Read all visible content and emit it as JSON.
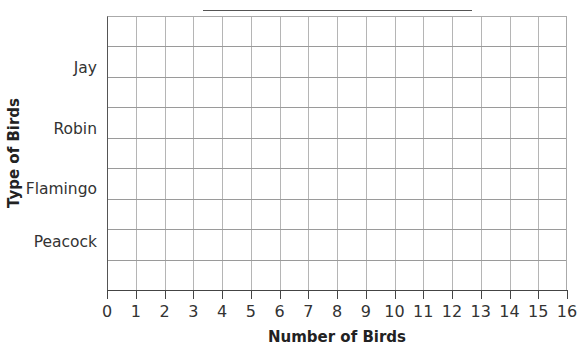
{
  "chart_data": {
    "type": "bar",
    "orientation": "horizontal",
    "title": "",
    "title_blank_line": true,
    "categories": [
      "Jay",
      "Robin",
      "Flamingo",
      "Peacock"
    ],
    "values": [
      null,
      null,
      null,
      null
    ],
    "xlabel": "Number of Birds",
    "ylabel": "Type of Birds",
    "xlim": [
      0,
      16
    ],
    "xticks": [
      "0",
      "1",
      "2",
      "3",
      "4",
      "5",
      "6",
      "7",
      "8",
      "9",
      "10",
      "11",
      "12",
      "13",
      "14",
      "15",
      "16"
    ],
    "grid": true,
    "legend": null,
    "note": "Blank bar graph template; no bars drawn"
  },
  "labels": {
    "xlabel": "Number of Birds",
    "ylabel": "Type of Birds",
    "categories": [
      "Jay",
      "Robin",
      "Flamingo",
      "Peacock"
    ],
    "xticks": [
      "0",
      "1",
      "2",
      "3",
      "4",
      "5",
      "6",
      "7",
      "8",
      "9",
      "10",
      "11",
      "12",
      "13",
      "14",
      "15",
      "16"
    ]
  }
}
